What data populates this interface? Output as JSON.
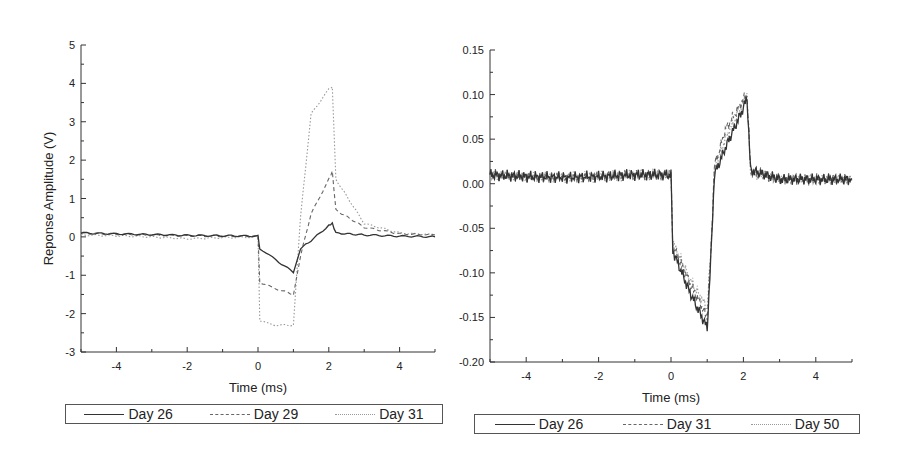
{
  "chart_data": [
    {
      "type": "line",
      "title": "",
      "xlabel": "Time (ms)",
      "ylabel": "Reponse Amplitude (V)",
      "xlim": [
        -5,
        5
      ],
      "ylim": [
        -3,
        5
      ],
      "xticks": [
        "-4",
        "-2",
        "0",
        "2",
        "4"
      ],
      "yticks": [
        "5",
        "4",
        "3",
        "2",
        "1",
        "0",
        "-1",
        "-2",
        "-3"
      ],
      "grid": false,
      "legend_position": "bottom",
      "x": [
        -5,
        -4,
        -3,
        -2,
        -1,
        0,
        0.05,
        0.5,
        1.0,
        1.2,
        1.5,
        2.0,
        2.1,
        2.2,
        3,
        4,
        5
      ],
      "series": [
        {
          "name": "Day 26",
          "style": "solid",
          "values": [
            0.1,
            0.08,
            0.06,
            0.04,
            0.03,
            0.02,
            -0.3,
            -0.6,
            -0.92,
            -0.3,
            -0.1,
            0.3,
            0.35,
            0.1,
            0.05,
            0.02,
            0.0
          ]
        },
        {
          "name": "Day 29",
          "style": "dashed",
          "values": [
            0.1,
            0.07,
            0.05,
            0.03,
            0.02,
            0.02,
            -1.2,
            -1.35,
            -1.5,
            -0.5,
            0.6,
            1.5,
            1.7,
            0.7,
            0.25,
            0.08,
            0.05
          ]
        },
        {
          "name": "Day 31",
          "style": "dotted",
          "values": [
            0.05,
            0.03,
            0.0,
            -0.05,
            -0.02,
            0.0,
            -2.2,
            -2.3,
            -2.3,
            0.5,
            3.2,
            3.85,
            3.9,
            1.5,
            0.35,
            0.1,
            0.05
          ]
        }
      ]
    },
    {
      "type": "line",
      "title": "",
      "xlabel": "Time (ms)",
      "ylabel": "Reponse Amplitude (V)",
      "xlim": [
        -5,
        5
      ],
      "ylim": [
        -0.2,
        0.15
      ],
      "xticks": [
        "-4",
        "-2",
        "0",
        "2",
        "4"
      ],
      "yticks": [
        "0.15",
        "0.10",
        "0.05",
        "0.00",
        "-0.05",
        "-0.10",
        "-0.15",
        "-0.20"
      ],
      "grid": false,
      "legend_position": "bottom",
      "x": [
        -5,
        -4,
        -3,
        -2,
        -1,
        0,
        0.05,
        0.5,
        1.0,
        1.1,
        1.2,
        1.5,
        2.0,
        2.1,
        2.2,
        3,
        4,
        5
      ],
      "series": [
        {
          "name": "Day 26",
          "style": "solid",
          "values": [
            0.01,
            0.008,
            0.007,
            0.008,
            0.01,
            0.01,
            -0.075,
            -0.12,
            -0.162,
            -0.085,
            0.01,
            0.04,
            0.085,
            0.097,
            0.015,
            0.005,
            0.005,
            0.005
          ]
        },
        {
          "name": "Day 31",
          "style": "dashed",
          "values": [
            0.01,
            0.008,
            0.007,
            0.008,
            0.01,
            0.01,
            -0.07,
            -0.11,
            -0.15,
            -0.08,
            0.02,
            0.06,
            0.095,
            0.1,
            0.015,
            0.005,
            0.005,
            0.005
          ]
        },
        {
          "name": "Day 50",
          "style": "dotted",
          "values": [
            0.01,
            0.008,
            0.007,
            0.008,
            0.01,
            0.01,
            -0.065,
            -0.105,
            -0.14,
            -0.075,
            0.015,
            0.05,
            0.09,
            0.1,
            0.012,
            0.005,
            0.005,
            0.005
          ]
        }
      ]
    }
  ],
  "left_chart": {
    "xlabel": "Time (ms)",
    "ylabel": "Reponse Amplitude (V)",
    "legend": [
      "Day 26",
      "Day 29",
      "Day 31"
    ]
  },
  "right_chart": {
    "xlabel": "Time (ms)",
    "ylabel": "Reponse Amplitude (V)",
    "legend": [
      "Day 26",
      "Day 31",
      "Day 50"
    ]
  }
}
